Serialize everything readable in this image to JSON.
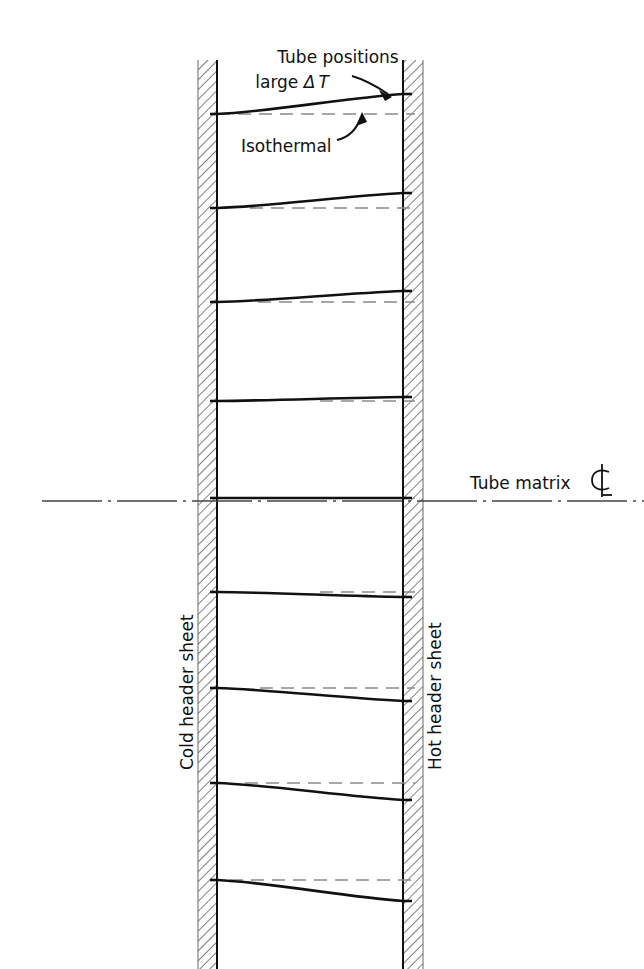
{
  "figure": {
    "type": "engineering-diagram",
    "background_color": "#ffffff",
    "line_color": "#111111",
    "hatch_color": "#555555",
    "dashed_color": "#777777"
  },
  "annotations": {
    "tube_positions_line1": "Tube positions",
    "tube_positions_line2_prefix": "large ",
    "tube_positions_line2_delta": "Δ",
    "tube_positions_line2_temp": "T",
    "isothermal": "Isothermal",
    "tube_matrix": "Tube matrix",
    "centerline_symbol": "℄"
  },
  "side_labels": {
    "left": "Cold header sheet",
    "right": "Hot header sheet"
  },
  "geometry": {
    "left_sheet": {
      "x": 198,
      "width": 19,
      "y": 60,
      "height": 909,
      "inner_edge_x": 217
    },
    "right_sheet": {
      "x": 403,
      "width": 20,
      "y": 60,
      "height": 909,
      "inner_edge_x": 403
    },
    "centerline": {
      "y": 501,
      "x_start": 42,
      "x_end": 644
    },
    "span_left_x": 217,
    "span_right_x": 403
  },
  "chart_data": {
    "type": "line",
    "xlabel": "Cold header sheet → Hot header sheet",
    "ylabel": "Tube row position",
    "x": [
      217,
      403
    ],
    "series": [
      {
        "name": "tube-1",
        "y_left": 114,
        "y_right": 94,
        "deflection": -20,
        "isothermal_y": 114,
        "isothermal_from_x": 217,
        "isothermal_to_x": 415
      },
      {
        "name": "tube-2",
        "y_left": 208,
        "y_right": 193,
        "deflection": -15,
        "isothermal_y": 208,
        "isothermal_from_x": 250,
        "isothermal_to_x": 415
      },
      {
        "name": "tube-3",
        "y_left": 302,
        "y_right": 291,
        "deflection": -11,
        "isothermal_y": 302,
        "isothermal_from_x": 258,
        "isothermal_to_x": 415
      },
      {
        "name": "tube-4",
        "y_left": 401,
        "y_right": 397,
        "deflection": -4,
        "isothermal_y": 401,
        "isothermal_from_x": 320,
        "isothermal_to_x": 415
      },
      {
        "name": "tube-5",
        "y_left": 498,
        "y_right": 498,
        "deflection": 0,
        "isothermal_y": 498,
        "isothermal_from_x": 350,
        "isothermal_to_x": 415
      },
      {
        "name": "tube-6",
        "y_left": 592,
        "y_right": 597,
        "deflection": 5,
        "isothermal_y": 592,
        "isothermal_from_x": 320,
        "isothermal_to_x": 415
      },
      {
        "name": "tube-7",
        "y_left": 688,
        "y_right": 701,
        "deflection": 13,
        "isothermal_y": 688,
        "isothermal_from_x": 260,
        "isothermal_to_x": 415
      },
      {
        "name": "tube-8",
        "y_left": 783,
        "y_right": 800,
        "deflection": 17,
        "isothermal_y": 783,
        "isothermal_from_x": 245,
        "isothermal_to_x": 415
      },
      {
        "name": "tube-9",
        "y_left": 880,
        "y_right": 901,
        "deflection": 21,
        "isothermal_y": 880,
        "isothermal_from_x": 230,
        "isothermal_to_x": 415
      }
    ],
    "axis_ranges": {
      "x": [
        217,
        403
      ],
      "y": [
        60,
        969
      ]
    },
    "grid": false,
    "legend": [
      "Tube positions large ΔT",
      "Isothermal"
    ]
  }
}
